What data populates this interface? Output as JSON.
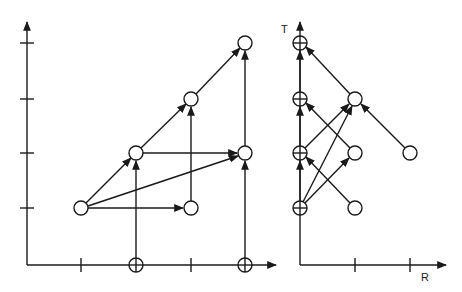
{
  "colors": {
    "stroke": "#1a1a1a",
    "background": "#ffffff"
  },
  "left_diagram": {
    "x_axis_label": "",
    "y_axis_label": "",
    "y_ticks": [
      "tick-1",
      "tick-2",
      "tick-3",
      "tick-4"
    ],
    "x_ticks": [
      "tick-1",
      "tick-2"
    ],
    "axis_crossed_nodes": [
      "crossed-x-1",
      "crossed-x-2"
    ],
    "nodes": [
      "A",
      "B",
      "C",
      "D",
      "E",
      "F"
    ],
    "edges": [
      [
        "A",
        "B"
      ],
      [
        "B",
        "C"
      ],
      [
        "C",
        "D"
      ],
      [
        "A",
        "E"
      ],
      [
        "B",
        "F"
      ],
      [
        "A",
        "F"
      ],
      [
        "E",
        "C"
      ],
      [
        "F",
        "D"
      ],
      [
        "crossed-x-1",
        "B"
      ],
      [
        "crossed-x-2",
        "F"
      ]
    ]
  },
  "right_diagram": {
    "y_axis_label": "T",
    "x_axis_label": "R",
    "x_ticks": [
      "tick-1",
      "tick-2"
    ],
    "axis_crossed_nodes": [
      "T1",
      "T2",
      "T3",
      "T4"
    ],
    "nodes": [
      "P",
      "Q",
      "S",
      "U"
    ],
    "edges": [
      [
        "T4",
        "T3"
      ],
      [
        "T3",
        "T2"
      ],
      [
        "T2",
        "T1"
      ],
      [
        "P",
        "T1"
      ],
      [
        "S",
        "P"
      ],
      [
        "Q",
        "T2"
      ],
      [
        "U",
        "T3"
      ],
      [
        "T3",
        "P"
      ],
      [
        "T4",
        "P"
      ],
      [
        "T4",
        "Q"
      ]
    ]
  }
}
